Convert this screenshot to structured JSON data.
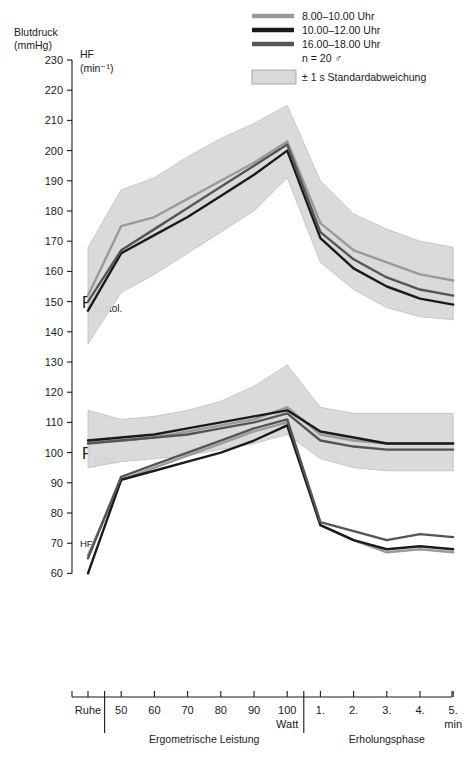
{
  "axes": {
    "y_title_line1": "Blutdruck",
    "y_title_line2": "(mmHg)",
    "hf_unit_line1": "HF",
    "hf_unit_line2": "(min⁻¹)",
    "hf_marker": "HF",
    "p_systol_main": "P",
    "p_systol_sub": "systol.",
    "p_diast_main": "P",
    "p_diast_sub": "diast.",
    "y_ticks": [
      230,
      220,
      210,
      200,
      190,
      180,
      170,
      160,
      150,
      140,
      130,
      120,
      110,
      100,
      90,
      80,
      70,
      60
    ],
    "x_tick_labels": [
      "Ruhe",
      "50",
      "60",
      "70",
      "80",
      "90",
      "100",
      "1.",
      "2.",
      "3.",
      "4.",
      "5."
    ],
    "watt_label": "Watt",
    "min_label": "min",
    "group_left": "Ergometrische Leistung",
    "group_right": "Erholungsphase"
  },
  "legend": {
    "entries": [
      {
        "label": "8.00–10.00 Uhr",
        "color": "#9a9a9a"
      },
      {
        "label": "10.00–12.00 Uhr",
        "color": "#1a1a1a"
      },
      {
        "label": "16.00–18.00 Uhr",
        "color": "#555555"
      }
    ],
    "n_label": "n = 20 ♂",
    "band_label": "± 1 s Standardabweichung",
    "band_color": "#d9d9d9"
  },
  "chart_data": {
    "type": "line",
    "xlabel": "Ergometrische Leistung / Erholungsphase",
    "ylabel": "Blutdruck (mmHg) / HF (min⁻¹)",
    "ylim": [
      55,
      232
    ],
    "grid": false,
    "legend_position": "top-right",
    "x": [
      "Ruhe",
      "50",
      "60",
      "70",
      "80",
      "90",
      "100",
      "1.",
      "2.",
      "3.",
      "4.",
      "5."
    ],
    "panels": [
      {
        "name": "P_systol.",
        "series": [
          {
            "name": "8.00–10.00 Uhr",
            "color": "#9a9a9a",
            "values": [
              152,
              175,
              178,
              184,
              190,
              196,
              203,
              176,
              167,
              163,
              159,
              157
            ]
          },
          {
            "name": "10.00–12.00 Uhr",
            "color": "#1a1a1a",
            "values": [
              147,
              166,
              172,
              178,
              185,
              192,
              200,
              171,
              161,
              155,
              151,
              149
            ]
          },
          {
            "name": "16.00–18.00 Uhr",
            "color": "#555555",
            "values": [
              150,
              167,
              174,
              181,
              188,
              195,
              202,
              173,
              164,
              158,
              154,
              152
            ]
          }
        ],
        "band_upper": [
          168,
          187,
          191,
          198,
          204,
          209,
          215,
          190,
          179,
          174,
          170,
          168
        ],
        "band_lower": [
          136,
          153,
          159,
          166,
          173,
          180,
          191,
          163,
          154,
          148,
          145,
          144
        ]
      },
      {
        "name": "P_diast.",
        "series": [
          {
            "name": "8.00–10.00 Uhr",
            "color": "#9a9a9a",
            "values": [
              104,
              104,
              105,
              107,
              109,
              111,
              115,
              106,
              104,
              103,
              103,
              103
            ]
          },
          {
            "name": "10.00–12.00 Uhr",
            "color": "#1a1a1a",
            "values": [
              104,
              105,
              106,
              108,
              110,
              112,
              114,
              107,
              105,
              103,
              103,
              103
            ]
          },
          {
            "name": "16.00–18.00 Uhr",
            "color": "#555555",
            "values": [
              103,
              104,
              105,
              106,
              108,
              110,
              113,
              104,
              102,
              101,
              101,
              101
            ]
          }
        ],
        "band_upper": [
          114,
          111,
          112,
          114,
          117,
          122,
          129,
          115,
          113,
          113,
          113,
          113
        ],
        "band_lower": [
          95,
          97,
          98,
          99,
          101,
          103,
          106,
          98,
          95,
          94,
          94,
          94
        ]
      },
      {
        "name": "HF",
        "series": [
          {
            "name": "8.00–10.00 Uhr",
            "color": "#9a9a9a",
            "values": [
              66,
              91,
              95,
              99,
              103,
              107,
              110,
              76,
              71,
              67,
              68,
              67
            ]
          },
          {
            "name": "10.00–12.00 Uhr",
            "color": "#1a1a1a",
            "values": [
              60,
              91,
              94,
              97,
              100,
              104,
              109,
              76,
              71,
              68,
              69,
              68
            ]
          },
          {
            "name": "16.00–18.00 Uhr",
            "color": "#555555",
            "values": [
              65,
              92,
              96,
              100,
              104,
              108,
              111,
              77,
              74,
              71,
              73,
              72
            ]
          }
        ]
      }
    ]
  }
}
